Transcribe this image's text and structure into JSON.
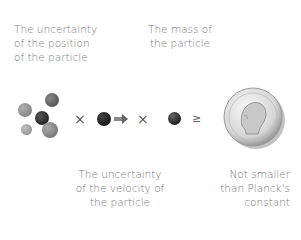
{
  "labels": {
    "position_uncertainty": [
      "The uncertainty",
      "of the position",
      "of the particle"
    ],
    "mass": [
      "The mass of",
      "the particle"
    ],
    "velocity_uncertainty": [
      "The uncertainty",
      "of the velocity of",
      "the particle"
    ],
    "planck": [
      "Not smaller",
      "than Planck's",
      "constant"
    ]
  },
  "operators": {
    "times_1": "×",
    "times_2": "×",
    "geq": "≥"
  },
  "colors": {
    "text": "#777777",
    "ball_dark": "#1a1a1a",
    "ball_mid": "#6e6e6e",
    "ball_light": "#9a9a9a"
  }
}
